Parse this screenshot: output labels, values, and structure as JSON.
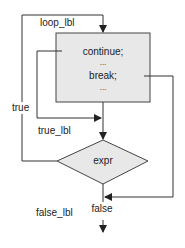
{
  "diagram": {
    "type": "flowchart",
    "colors": {
      "line": "#333333",
      "fill": "#e8e8e8",
      "text": "#222222"
    },
    "labels": {
      "loop_label": "loop_lbl",
      "true_label": "true_lbl",
      "false_label": "false_lbl",
      "true_edge": "true",
      "false_edge": "false"
    },
    "body_block": {
      "lines": [
        "continue;",
        "...",
        "break;",
        "..."
      ]
    },
    "condition": {
      "text": "expr"
    }
  }
}
